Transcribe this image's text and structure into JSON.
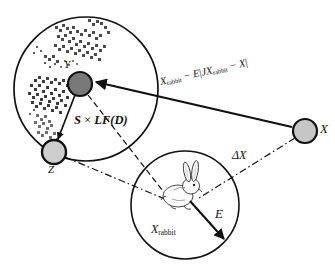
{
  "diagram": {
    "nodes": [
      {
        "id": "Y",
        "label": "Y",
        "fill": "#787878",
        "stroke": "#000000",
        "cx": 80,
        "cy": 84,
        "r": 12
      },
      {
        "id": "Z",
        "label": "Z",
        "fill": "#cdcdcd",
        "stroke": "#000000",
        "cx": 54,
        "cy": 152,
        "r": 12
      },
      {
        "id": "X",
        "label": "X",
        "fill": "#c6c6c6",
        "stroke": "#000000",
        "cx": 305,
        "cy": 131,
        "r": 12
      }
    ],
    "circles": [
      {
        "id": "search-region",
        "cx": 86,
        "cy": 89,
        "r": 72,
        "stroke": "#000000"
      },
      {
        "id": "rabbit-region",
        "cx": 185,
        "cy": 205,
        "r": 54,
        "stroke": "#000000"
      }
    ],
    "labels": {
      "node_y": "Y",
      "node_z": "Z",
      "node_x": "X",
      "escape_energy": "E",
      "delta_x": "ΔX",
      "levy_term_bold": "S",
      "levy_term_op": " × ",
      "levy_term_rest": "LF(D)",
      "rabbit_position": "X",
      "rabbit_position_sub": "rabbit",
      "formula_p1": "X",
      "formula_sub1": "rabbit",
      "formula_mid": " − E",
      "formula_bar1": "|",
      "formula_j": "J",
      "formula_p2": "X",
      "formula_sub2": "rabbit",
      "formula_end": " − X",
      "formula_bar2": "|"
    },
    "edges": [
      {
        "id": "x-to-y",
        "style": "solid-arrow",
        "from": "X",
        "to": "Y",
        "label": "X_rabbit - E|JX_rabbit - X|"
      },
      {
        "id": "y-to-z",
        "style": "solid-arrow",
        "from": "Y",
        "to": "Z",
        "label": ""
      },
      {
        "id": "y-to-rabbit",
        "style": "dashed",
        "from": "Y",
        "to": "rabbit",
        "label": "S x LF(D)"
      },
      {
        "id": "z-to-rabbit",
        "style": "dashdot",
        "from": "Z",
        "to": "rabbit",
        "label": ""
      },
      {
        "id": "x-to-rabbit",
        "style": "dashdot",
        "from": "X",
        "to": "rabbit",
        "label": "ΔX"
      },
      {
        "id": "rabbit-escape",
        "style": "solid-arrow",
        "from": "rabbit",
        "to": "down-right",
        "label": "E"
      }
    ],
    "levy_flight_clusters": [
      {
        "cx": 62,
        "cy": 35,
        "spread": 16,
        "points": 46
      },
      {
        "cx": 88,
        "cy": 42,
        "spread": 14,
        "points": 40
      },
      {
        "cx": 47,
        "cy": 93,
        "spread": 15,
        "points": 44
      },
      {
        "cx": 46,
        "cy": 124,
        "spread": 11,
        "points": 30
      },
      {
        "cx": 100,
        "cy": 57,
        "spread": 9,
        "points": 18
      }
    ],
    "icons": {
      "prey": "rabbit-icon"
    }
  }
}
